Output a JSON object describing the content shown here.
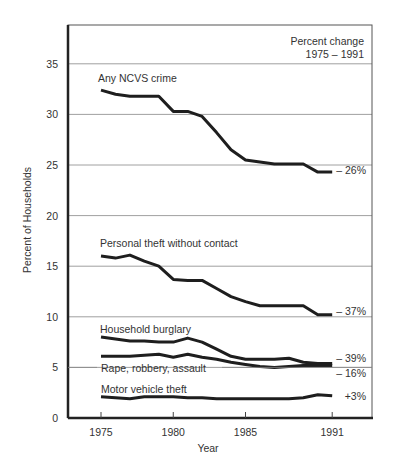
{
  "chart_data": {
    "type": "line",
    "title": "",
    "xlabel": "Year",
    "ylabel": "Percent of Households",
    "ylim": [
      0,
      38
    ],
    "yticks": [
      0,
      5,
      10,
      15,
      20,
      25,
      30,
      35
    ],
    "xticks": [
      1975,
      1980,
      1985,
      1991
    ],
    "xlim": [
      1973,
      1993
    ],
    "grid": "horizontal",
    "legend_position": "inline labels",
    "annotation_header": [
      "Percent change",
      "1975 – 1991"
    ],
    "x": [
      1975,
      1976,
      1977,
      1978,
      1979,
      1980,
      1981,
      1982,
      1983,
      1984,
      1985,
      1986,
      1987,
      1988,
      1989,
      1990,
      1991
    ],
    "series": [
      {
        "name": "Any NCVS crime",
        "values": [
          32.4,
          32.0,
          31.8,
          31.8,
          31.8,
          30.3,
          30.3,
          29.8,
          28.2,
          26.5,
          25.5,
          25.3,
          25.1,
          25.1,
          25.1,
          24.3,
          24.3
        ],
        "change_label": "– 26%"
      },
      {
        "name": "Personal theft without contact",
        "values": [
          16.0,
          15.8,
          16.1,
          15.5,
          15.0,
          13.7,
          13.6,
          13.6,
          12.8,
          12.0,
          11.5,
          11.1,
          11.1,
          11.1,
          11.1,
          10.2,
          10.2
        ],
        "change_label": "– 37%"
      },
      {
        "name": "Household burglary",
        "values": [
          8.0,
          7.8,
          7.6,
          7.6,
          7.5,
          7.5,
          7.9,
          7.5,
          6.8,
          6.1,
          5.8,
          5.8,
          5.8,
          5.9,
          5.5,
          5.4,
          5.4
        ],
        "change_label": "– 39%"
      },
      {
        "name": "Rape, robbery, assault",
        "values": [
          6.1,
          6.1,
          6.1,
          6.2,
          6.3,
          6.0,
          6.3,
          6.0,
          5.8,
          5.5,
          5.3,
          5.1,
          5.0,
          5.1,
          5.2,
          5.2,
          5.2
        ],
        "change_label": "– 16%"
      },
      {
        "name": "Motor vehicle theft",
        "values": [
          2.1,
          2.0,
          1.9,
          2.1,
          2.1,
          2.1,
          2.0,
          2.0,
          1.9,
          1.9,
          1.9,
          1.9,
          1.9,
          1.9,
          2.0,
          2.3,
          2.2
        ],
        "change_label": "+3%"
      }
    ]
  }
}
